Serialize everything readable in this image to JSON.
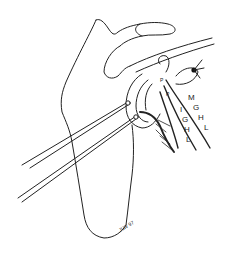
{
  "figure": {
    "labels": {
      "mghl": [
        "M",
        "G",
        "H",
        "L"
      ],
      "ighl": [
        "I",
        "G",
        "H",
        "L"
      ],
      "labrum_marks": [
        "P",
        "P"
      ]
    },
    "signature": "JLW 97",
    "colors": {
      "line": "#222222",
      "background": "#ffffff"
    }
  }
}
